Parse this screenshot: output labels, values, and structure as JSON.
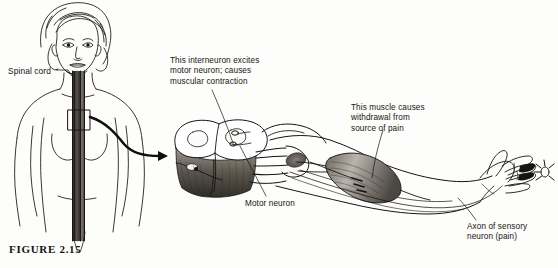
{
  "figure": {
    "caption": "FIGURE  2.15",
    "background_color": "#fdfdfc",
    "ink_color": "#161412"
  },
  "labels": {
    "spinal_cord": "Spinal cord",
    "interneuron": "This interneuron excites\nmotor neuron; causes\nmuscular contraction",
    "muscle": "This muscle causes\nwithdrawal from\nsource of pain",
    "motor_neuron": "Motor neuron",
    "sensory_axon": "Axon of sensory\nneuron (pain)"
  },
  "illustration": {
    "parts": [
      "female-figure-head-and-torso",
      "spinal-cord-column",
      "magnification-box",
      "magnification-arrow",
      "spinal-cord-cross-section-block",
      "gray-matter-butterfly",
      "nerve-roots",
      "arm",
      "biceps-muscle",
      "hand",
      "pain-stimulus-fingertip"
    ]
  }
}
